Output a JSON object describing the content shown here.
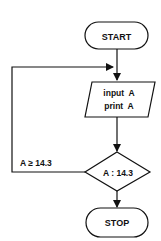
{
  "flowchart": {
    "start": {
      "label": "START"
    },
    "io": {
      "line1": "input  A",
      "line2": "print  A"
    },
    "decision": {
      "label": "A : 14.3"
    },
    "loop_condition": {
      "label": "A ≥ 14.3"
    },
    "stop": {
      "label": "STOP"
    }
  },
  "colors": {
    "stroke": "#111111",
    "background": "#ffffff"
  }
}
